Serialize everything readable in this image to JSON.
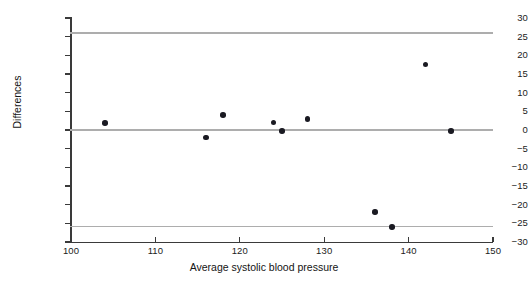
{
  "chart_data": {
    "type": "scatter",
    "title": "",
    "xlabel": "Average systolic blood pressure",
    "ylabel": "Differences",
    "xlim": [
      100,
      150
    ],
    "ylim": [
      -30,
      30
    ],
    "xticks": [
      100,
      110,
      120,
      130,
      140,
      150
    ],
    "yticks": [
      30,
      25,
      20,
      15,
      10,
      5,
      0,
      -5,
      -10,
      -15,
      -20,
      -25,
      -30
    ],
    "xticklabels": [
      "100",
      "110",
      "120",
      "130",
      "140",
      "150"
    ],
    "yticklabels": [
      "30",
      "25",
      "20",
      "15",
      "10",
      "5",
      "0",
      "−5",
      "−10",
      "−15",
      "−20",
      "−25",
      "−30"
    ],
    "grid": false,
    "legend": null,
    "point_color": "#1a1a22",
    "reference_line_color": "#adadad",
    "axis_color": "#3a3a3a",
    "reference_lines": [
      {
        "name": "upper-limit-of-agreement",
        "value": 26.0
      },
      {
        "name": "mean-difference",
        "value": 0.0
      },
      {
        "name": "lower-limit-of-agreement",
        "value": -25.8
      }
    ],
    "points": [
      {
        "x": 104,
        "y": 1.9
      },
      {
        "x": 116,
        "y": -2.0
      },
      {
        "x": 118,
        "y": 4.0
      },
      {
        "x": 124,
        "y": 2.0
      },
      {
        "x": 125,
        "y": -0.2
      },
      {
        "x": 128,
        "y": 2.9
      },
      {
        "x": 136,
        "y": -22.0
      },
      {
        "x": 138,
        "y": -26.0
      },
      {
        "x": 142,
        "y": 17.5
      },
      {
        "x": 145,
        "y": -0.3
      }
    ]
  }
}
